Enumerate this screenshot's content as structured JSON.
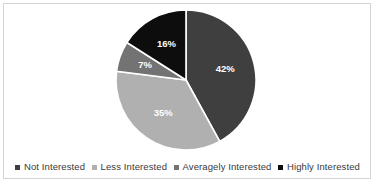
{
  "chart_data": {
    "type": "pie",
    "title": "",
    "subtitle": "",
    "xlabel": "",
    "ylabel": "",
    "grid": false,
    "legend_position": "bottom",
    "start_angle_deg": 0,
    "direction": "clockwise",
    "categories": [
      "Not Interested",
      "Less Interested",
      "Averagely Interested",
      "Highly Interested"
    ],
    "values": [
      42,
      35,
      7,
      16
    ],
    "value_unit": "%",
    "data_labels": [
      "42%",
      "35%",
      "7%",
      "16%"
    ],
    "colors": [
      "#3f3f3f",
      "#b0b0b0",
      "#737373",
      "#0d0d0d"
    ],
    "slices": [
      {
        "label": "Not Interested",
        "value": 42,
        "data_label": "42%",
        "color": "#3f3f3f"
      },
      {
        "label": "Less Interested",
        "value": 35,
        "data_label": "35%",
        "color": "#b0b0b0"
      },
      {
        "label": "Averagely Interested",
        "value": 7,
        "data_label": "7%",
        "color": "#737373"
      },
      {
        "label": "Highly Interested",
        "value": 16,
        "data_label": "16%",
        "color": "#0d0d0d"
      }
    ]
  },
  "legend": {
    "items": [
      {
        "label": "Not Interested",
        "color": "#3f3f3f"
      },
      {
        "label": "Less Interested",
        "color": "#b0b0b0"
      },
      {
        "label": "Averagely Interested",
        "color": "#737373"
      },
      {
        "label": "Highly Interested",
        "color": "#0d0d0d"
      }
    ]
  },
  "style": {
    "frame_border_color": "#d4d4d4",
    "plot_background": "#ffffff",
    "label_text_color": "#ffffff",
    "legend_text_color": "#3a3a3a"
  }
}
